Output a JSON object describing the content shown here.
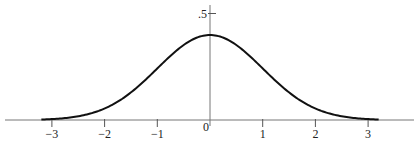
{
  "chart_data": {
    "type": "line",
    "title": "",
    "xlabel": "",
    "ylabel": "",
    "series": [
      {
        "name": "standard normal density",
        "x": [
          -3.2,
          -3.0,
          -2.5,
          -2.0,
          -1.5,
          -1.0,
          -0.5,
          0.0,
          0.5,
          1.0,
          1.5,
          2.0,
          2.5,
          3.0,
          3.2
        ],
        "values": [
          0.0024,
          0.0044,
          0.0175,
          0.054,
          0.1295,
          0.242,
          0.3521,
          0.3989,
          0.3521,
          0.242,
          0.1295,
          0.054,
          0.0175,
          0.0044,
          0.0024
        ]
      }
    ],
    "x_ticks": [
      -3,
      -2,
      -1,
      0,
      1,
      2,
      3
    ],
    "x_tick_labels": [
      "−3",
      "−2",
      "−1",
      "0",
      "1",
      "2",
      "3"
    ],
    "y_ticks": [
      0.5
    ],
    "y_tick_labels": [
      ".5"
    ],
    "xlim": [
      -3.9,
      3.9
    ],
    "ylim": [
      0,
      0.55
    ],
    "grid": false,
    "legend": null
  },
  "layout": {
    "origin_px": [
      210,
      120
    ],
    "x_unit_px": 52.7,
    "y_unit_px": 213,
    "curve_color": "#111111",
    "axis_color": "#777777"
  }
}
